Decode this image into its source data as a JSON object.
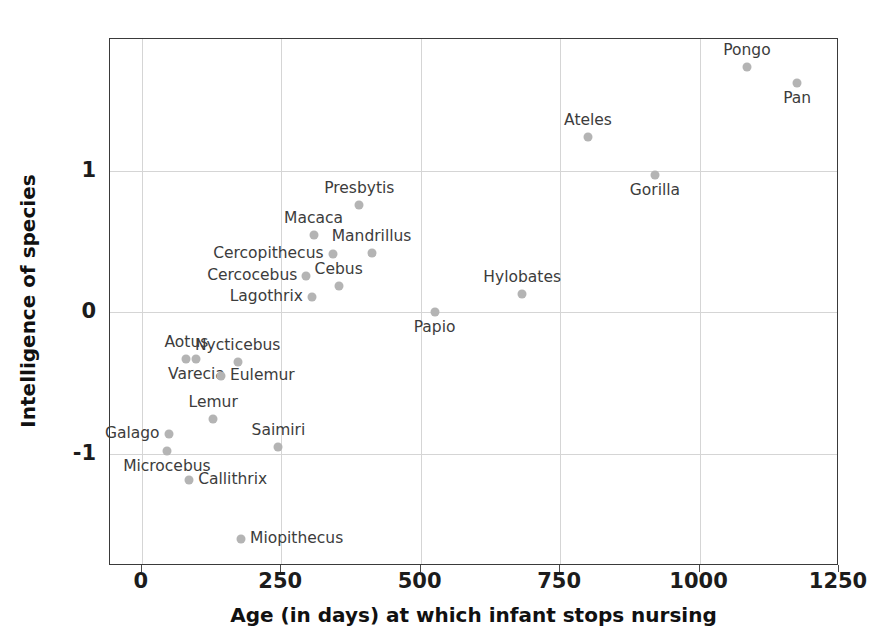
{
  "chart_data": {
    "type": "scatter",
    "title": "",
    "xlabel": "Age (in days) at which infant stops nursing",
    "ylabel": "Intelligence of species",
    "xlim": [
      -57,
      1250
    ],
    "ylim": [
      -1.79,
      1.93
    ],
    "xticks": [
      0,
      250,
      500,
      750,
      1000,
      1250
    ],
    "xticklabels": [
      "0",
      "250",
      "500",
      "750",
      "1000",
      "1250"
    ],
    "yticks": [
      1,
      0,
      -1
    ],
    "yticklabels": [
      "1",
      "0",
      "-1"
    ],
    "grid": true,
    "legend": "none",
    "marker_color": "#b4b4b4",
    "label_color": "#3c3c3c",
    "axis_color": "#3a3a3a",
    "points": [
      {
        "name": "Pongo",
        "x": 1085,
        "y": 1.73,
        "label_pos": "above"
      },
      {
        "name": "Pan",
        "x": 1175,
        "y": 1.62,
        "label_pos": "below"
      },
      {
        "name": "Ateles",
        "x": 800,
        "y": 1.24,
        "label_pos": "above"
      },
      {
        "name": "Gorilla",
        "x": 920,
        "y": 0.97,
        "label_pos": "below"
      },
      {
        "name": "Presbytis",
        "x": 390,
        "y": 0.76,
        "label_pos": "above"
      },
      {
        "name": "Macaca",
        "x": 308,
        "y": 0.55,
        "label_pos": "above"
      },
      {
        "name": "Mandrillus",
        "x": 412,
        "y": 0.42,
        "label_pos": "above"
      },
      {
        "name": "Cercopithecus",
        "x": 342,
        "y": 0.41,
        "label_pos": "left"
      },
      {
        "name": "Cercocebus",
        "x": 295,
        "y": 0.26,
        "label_pos": "left"
      },
      {
        "name": "Cebus",
        "x": 353,
        "y": 0.19,
        "label_pos": "above"
      },
      {
        "name": "Lagothrix",
        "x": 305,
        "y": 0.11,
        "label_pos": "left"
      },
      {
        "name": "Hylobates",
        "x": 682,
        "y": 0.13,
        "label_pos": "above"
      },
      {
        "name": "Papio",
        "x": 525,
        "y": 0.0,
        "label_pos": "below"
      },
      {
        "name": "Aotus",
        "x": 80,
        "y": -0.33,
        "label_pos": "above"
      },
      {
        "name": "Varecia",
        "x": 98,
        "y": -0.33,
        "label_pos": "below"
      },
      {
        "name": "Nycticebus",
        "x": 172,
        "y": -0.35,
        "label_pos": "above"
      },
      {
        "name": "Eulemur",
        "x": 142,
        "y": -0.45,
        "label_pos": "right"
      },
      {
        "name": "Lemur",
        "x": 128,
        "y": -0.75,
        "label_pos": "above"
      },
      {
        "name": "Saimiri",
        "x": 245,
        "y": -0.95,
        "label_pos": "above"
      },
      {
        "name": "Galago",
        "x": 48,
        "y": -0.86,
        "label_pos": "left"
      },
      {
        "name": "Microcebus",
        "x": 45,
        "y": -0.98,
        "label_pos": "below"
      },
      {
        "name": "Callithrix",
        "x": 85,
        "y": -1.18,
        "label_pos": "right"
      },
      {
        "name": "Miopithecus",
        "x": 178,
        "y": -1.6,
        "label_pos": "right"
      }
    ]
  }
}
